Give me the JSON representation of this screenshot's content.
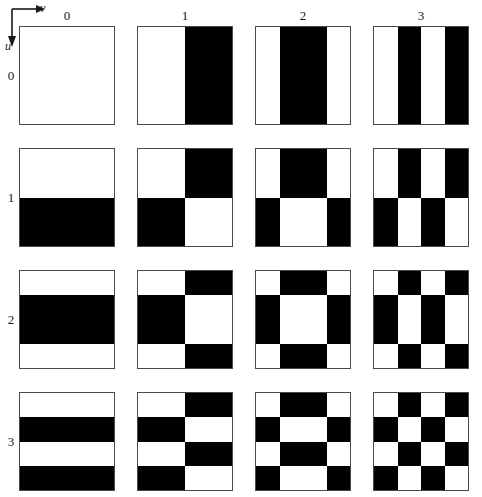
{
  "figure": {
    "type": "walsh-basis-grid",
    "rows": 4,
    "cols": 4,
    "ink_color": "#000000",
    "paper_color": "#ffffff",
    "border_color": "#4a4a4a"
  },
  "axes": {
    "horizontal_label": "v",
    "vertical_label": "u",
    "horizontal_icon": "right-arrow-icon",
    "vertical_icon": "down-arrow-icon"
  },
  "column_headers": [
    "0",
    "1",
    "2",
    "3"
  ],
  "row_headers": [
    "0",
    "1",
    "2",
    "3"
  ],
  "chart_data": {
    "type": "heatmap",
    "title": "",
    "xlabel": "v",
    "ylabel": "u",
    "walsh_vectors": {
      "0": [
        0,
        0,
        0,
        0
      ],
      "1": [
        0,
        0,
        1,
        1
      ],
      "2": [
        0,
        1,
        1,
        0
      ],
      "3": [
        0,
        1,
        0,
        1
      ]
    },
    "categories_x": [
      "0",
      "1",
      "2",
      "3"
    ],
    "categories_y": [
      "0",
      "1",
      "2",
      "3"
    ],
    "tiles": [
      {
        "u": 0,
        "v": 0,
        "matrix": [
          [
            0,
            0,
            0,
            0
          ],
          [
            0,
            0,
            0,
            0
          ],
          [
            0,
            0,
            0,
            0
          ],
          [
            0,
            0,
            0,
            0
          ]
        ]
      },
      {
        "u": 0,
        "v": 1,
        "matrix": [
          [
            0,
            0,
            1,
            1
          ],
          [
            0,
            0,
            1,
            1
          ],
          [
            0,
            0,
            1,
            1
          ],
          [
            0,
            0,
            1,
            1
          ]
        ]
      },
      {
        "u": 0,
        "v": 2,
        "matrix": [
          [
            0,
            1,
            1,
            0
          ],
          [
            0,
            1,
            1,
            0
          ],
          [
            0,
            1,
            1,
            0
          ],
          [
            0,
            1,
            1,
            0
          ]
        ]
      },
      {
        "u": 0,
        "v": 3,
        "matrix": [
          [
            0,
            1,
            0,
            1
          ],
          [
            0,
            1,
            0,
            1
          ],
          [
            0,
            1,
            0,
            1
          ],
          [
            0,
            1,
            0,
            1
          ]
        ]
      },
      {
        "u": 1,
        "v": 0,
        "matrix": [
          [
            0,
            0,
            0,
            0
          ],
          [
            0,
            0,
            0,
            0
          ],
          [
            1,
            1,
            1,
            1
          ],
          [
            1,
            1,
            1,
            1
          ]
        ]
      },
      {
        "u": 1,
        "v": 1,
        "matrix": [
          [
            0,
            0,
            1,
            1
          ],
          [
            0,
            0,
            1,
            1
          ],
          [
            1,
            1,
            0,
            0
          ],
          [
            1,
            1,
            0,
            0
          ]
        ]
      },
      {
        "u": 1,
        "v": 2,
        "matrix": [
          [
            0,
            1,
            1,
            0
          ],
          [
            0,
            1,
            1,
            0
          ],
          [
            1,
            0,
            0,
            1
          ],
          [
            1,
            0,
            0,
            1
          ]
        ]
      },
      {
        "u": 1,
        "v": 3,
        "matrix": [
          [
            0,
            1,
            0,
            1
          ],
          [
            0,
            1,
            0,
            1
          ],
          [
            1,
            0,
            1,
            0
          ],
          [
            1,
            0,
            1,
            0
          ]
        ]
      },
      {
        "u": 2,
        "v": 0,
        "matrix": [
          [
            0,
            0,
            0,
            0
          ],
          [
            1,
            1,
            1,
            1
          ],
          [
            1,
            1,
            1,
            1
          ],
          [
            0,
            0,
            0,
            0
          ]
        ]
      },
      {
        "u": 2,
        "v": 1,
        "matrix": [
          [
            0,
            0,
            1,
            1
          ],
          [
            1,
            1,
            0,
            0
          ],
          [
            1,
            1,
            0,
            0
          ],
          [
            0,
            0,
            1,
            1
          ]
        ]
      },
      {
        "u": 2,
        "v": 2,
        "matrix": [
          [
            0,
            1,
            1,
            0
          ],
          [
            1,
            0,
            0,
            1
          ],
          [
            1,
            0,
            0,
            1
          ],
          [
            0,
            1,
            1,
            0
          ]
        ]
      },
      {
        "u": 2,
        "v": 3,
        "matrix": [
          [
            0,
            1,
            0,
            1
          ],
          [
            1,
            0,
            1,
            0
          ],
          [
            1,
            0,
            1,
            0
          ],
          [
            0,
            1,
            0,
            1
          ]
        ]
      },
      {
        "u": 3,
        "v": 0,
        "matrix": [
          [
            0,
            0,
            0,
            0
          ],
          [
            1,
            1,
            1,
            1
          ],
          [
            0,
            0,
            0,
            0
          ],
          [
            1,
            1,
            1,
            1
          ]
        ]
      },
      {
        "u": 3,
        "v": 1,
        "matrix": [
          [
            0,
            0,
            1,
            1
          ],
          [
            1,
            1,
            0,
            0
          ],
          [
            0,
            0,
            1,
            1
          ],
          [
            1,
            1,
            0,
            0
          ]
        ]
      },
      {
        "u": 3,
        "v": 2,
        "matrix": [
          [
            0,
            1,
            1,
            0
          ],
          [
            1,
            0,
            0,
            1
          ],
          [
            0,
            1,
            1,
            0
          ],
          [
            1,
            0,
            0,
            1
          ]
        ]
      },
      {
        "u": 3,
        "v": 3,
        "matrix": [
          [
            0,
            1,
            0,
            1
          ],
          [
            1,
            0,
            1,
            0
          ],
          [
            0,
            1,
            0,
            1
          ],
          [
            1,
            0,
            1,
            0
          ]
        ]
      }
    ]
  },
  "artifacts": {
    "scan_mark": {
      "present": true,
      "u": 2,
      "v": 3,
      "description": "small handwritten-looking scanning artifact near the right edge"
    }
  },
  "layout": {
    "grid_origin_x": 19,
    "grid_origin_y": 26,
    "col_pitch": 118,
    "row_pitch": 122,
    "cell_width": 96,
    "cell_height": 99,
    "col_header_y": 9,
    "row_header_x": 4
  }
}
